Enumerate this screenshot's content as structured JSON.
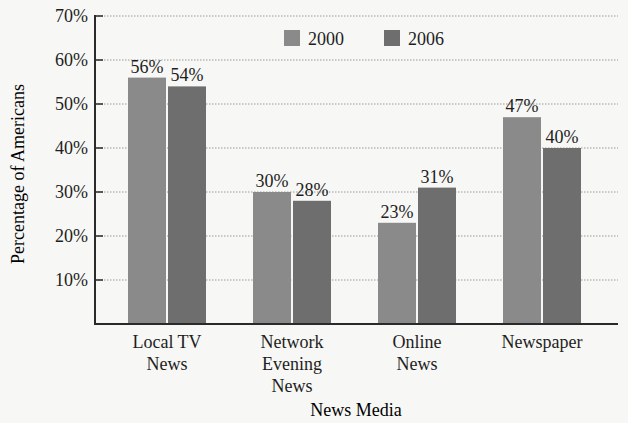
{
  "chart_data": {
    "type": "bar",
    "title": "",
    "xlabel": "News Media",
    "ylabel": "Percentage of Americans",
    "ylim": [
      0,
      70
    ],
    "yticks": [
      "10%",
      "20%",
      "30%",
      "40%",
      "50%",
      "60%",
      "70%"
    ],
    "grid": "horizontal dotted",
    "legend_position": "top-center inside plot",
    "categories": [
      [
        "Local TV",
        "News"
      ],
      [
        "Network",
        "Evening",
        "News"
      ],
      [
        "Online",
        "News"
      ],
      [
        "Newspaper"
      ]
    ],
    "series": [
      {
        "name": "2000",
        "color": "#8a8a8a",
        "values": [
          56,
          30,
          23,
          47
        ],
        "labels": [
          "56%",
          "30%",
          "23%",
          "47%"
        ]
      },
      {
        "name": "2006",
        "color": "#6e6e6e",
        "values": [
          54,
          28,
          31,
          40
        ],
        "labels": [
          "54%",
          "28%",
          "31%",
          "40%"
        ]
      }
    ]
  },
  "colors": {
    "axis": "#2a2a2a",
    "grid": "#9a9a9a",
    "text": "#1e1e1e",
    "background": "#f7f7f5"
  }
}
